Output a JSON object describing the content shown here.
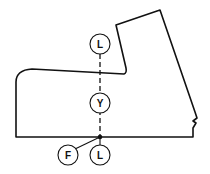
{
  "diagram": {
    "labels": {
      "top_circle": "L",
      "middle_circle": "Y",
      "bottom_circle": "L",
      "pointer_circle": "F"
    },
    "colors": {
      "stroke": "#111111",
      "background": "#ffffff"
    }
  }
}
